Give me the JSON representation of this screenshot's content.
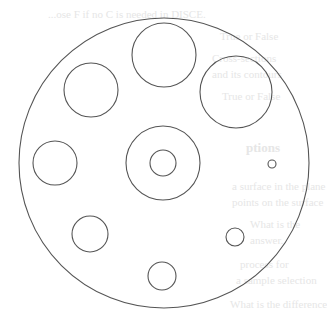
{
  "figure": {
    "stroke_color": "#555555",
    "background_color": "#ffffff",
    "outer_circle": {
      "cx": 164,
      "cy": 163,
      "r": 145
    },
    "inner_circles": [
      {
        "id": "top",
        "cx": 164,
        "cy": 55,
        "r": 32
      },
      {
        "id": "upper-left",
        "cx": 91,
        "cy": 90,
        "r": 27
      },
      {
        "id": "upper-right",
        "cx": 236,
        "cy": 92,
        "r": 36
      },
      {
        "id": "left",
        "cx": 55,
        "cy": 163,
        "r": 22
      },
      {
        "id": "center-outer",
        "cx": 163,
        "cy": 163,
        "r": 37
      },
      {
        "id": "center-inner",
        "cx": 163,
        "cy": 163,
        "r": 13
      },
      {
        "id": "right-small",
        "cx": 272,
        "cy": 164,
        "r": 4
      },
      {
        "id": "lower-left",
        "cx": 90,
        "cy": 234,
        "r": 18
      },
      {
        "id": "lower-right",
        "cx": 235,
        "cy": 237,
        "r": 9
      },
      {
        "id": "bottom",
        "cx": 162,
        "cy": 276,
        "r": 14
      }
    ]
  },
  "bleed_through_text": [
    {
      "text": "...ose F if no C is needed in DISCE.",
      "x": 48,
      "y": 8,
      "bold": false
    },
    {
      "text": "True or False",
      "x": 220,
      "y": 30,
      "bold": false
    },
    {
      "text": "Cross-sections",
      "x": 212,
      "y": 52,
      "bold": false
    },
    {
      "text": "and its contours",
      "x": 212,
      "y": 68,
      "bold": false
    },
    {
      "text": "True or False",
      "x": 222,
      "y": 90,
      "bold": false
    },
    {
      "text": "ptions",
      "x": 246,
      "y": 140,
      "bold": true
    },
    {
      "text": "a surface in the plane",
      "x": 232,
      "y": 180,
      "bold": false
    },
    {
      "text": "points on the surface",
      "x": 232,
      "y": 196,
      "bold": false
    },
    {
      "text": "What is the",
      "x": 250,
      "y": 218,
      "bold": false
    },
    {
      "text": "answer.",
      "x": 250,
      "y": 234,
      "bold": false
    },
    {
      "text": "process for",
      "x": 240,
      "y": 258,
      "bold": false
    },
    {
      "text": "a sample selection",
      "x": 236,
      "y": 274,
      "bold": false
    },
    {
      "text": "What is the difference",
      "x": 230,
      "y": 298,
      "bold": false
    }
  ]
}
